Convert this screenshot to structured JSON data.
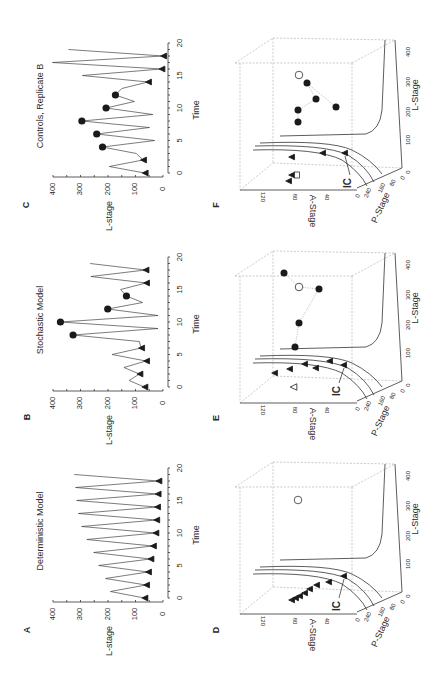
{
  "figure": {
    "panel_letters": [
      "A",
      "B",
      "C",
      "D",
      "E",
      "F"
    ],
    "ic_label": "IC"
  },
  "chart_data": [
    {
      "panel": "A",
      "type": "line",
      "title": "Deterministic Model",
      "xlabel": "Time",
      "ylabel": "L-stage",
      "xlim": [
        0,
        20
      ],
      "ylim": [
        0,
        400
      ],
      "xticks": [
        "0",
        "5",
        "10",
        "15",
        "20"
      ],
      "yticks": [
        "0",
        "100",
        "200",
        "300",
        "400"
      ],
      "x": [
        0,
        1,
        2,
        3,
        4,
        5,
        6,
        7,
        8,
        9,
        10,
        11,
        12,
        13,
        14,
        15,
        16,
        17,
        18,
        19
      ],
      "values": [
        68,
        191,
        62,
        209,
        55,
        234,
        46,
        252,
        37,
        277,
        28,
        296,
        25,
        308,
        22,
        314,
        20,
        318,
        17,
        323
      ],
      "markers": [
        {
          "t": 0,
          "shape": "triangle"
        },
        {
          "t": 2,
          "shape": "triangle"
        },
        {
          "t": 4,
          "shape": "triangle"
        },
        {
          "t": 6,
          "shape": "triangle"
        },
        {
          "t": 8,
          "shape": "triangle"
        },
        {
          "t": 10,
          "shape": "triangle"
        },
        {
          "t": 12,
          "shape": "triangle"
        },
        {
          "t": 14,
          "shape": "triangle"
        },
        {
          "t": 16,
          "shape": "triangle"
        },
        {
          "t": 18,
          "shape": "triangle"
        }
      ]
    },
    {
      "panel": "B",
      "type": "line",
      "title": "Stochastic Model",
      "xlabel": "Time",
      "ylabel": "L-stage",
      "xlim": [
        0,
        20
      ],
      "ylim": [
        0,
        400
      ],
      "xticks": [
        "0",
        "5",
        "10",
        "15",
        "20"
      ],
      "yticks": [
        "0",
        "100",
        "200",
        "300",
        "400"
      ],
      "x": [
        0,
        1,
        2,
        3,
        4,
        5,
        6,
        7,
        8,
        9,
        10,
        11,
        12,
        13,
        14,
        15,
        16,
        17,
        18,
        19
      ],
      "values": [
        68,
        123,
        86,
        142,
        62,
        185,
        80,
        86,
        327,
        18,
        373,
        18,
        201,
        74,
        133,
        154,
        62,
        262,
        64,
        265
      ],
      "markers": [
        {
          "t": 0,
          "shape": "triangle"
        },
        {
          "t": 2,
          "shape": "triangle"
        },
        {
          "t": 4,
          "shape": "triangle"
        },
        {
          "t": 6,
          "shape": "triangle"
        },
        {
          "t": 8,
          "shape": "circle"
        },
        {
          "t": 10,
          "shape": "circle"
        },
        {
          "t": 12,
          "shape": "circle"
        },
        {
          "t": 14,
          "shape": "circle"
        },
        {
          "t": 16,
          "shape": "triangle"
        },
        {
          "t": 18,
          "shape": "triangle"
        }
      ]
    },
    {
      "panel": "C",
      "type": "line",
      "title": "Controls, Replicate B",
      "xlabel": "Time",
      "ylabel": "L-stage",
      "xlim": [
        0,
        20
      ],
      "ylim": [
        0,
        400
      ],
      "xticks": [
        "0",
        "5",
        "10",
        "15",
        "20"
      ],
      "yticks": [
        "0",
        "100",
        "200",
        "300",
        "400"
      ],
      "x": [
        0,
        1,
        2,
        3,
        4,
        5,
        6,
        7,
        8,
        9,
        10,
        11,
        12,
        13,
        14,
        15,
        16,
        17,
        18,
        19
      ],
      "values": [
        67,
        195,
        73,
        97,
        220,
        30,
        241,
        49,
        295,
        37,
        207,
        104,
        173,
        150,
        55,
        293,
        6,
        402,
        0,
        344
      ],
      "markers": [
        {
          "t": 0,
          "shape": "triangle"
        },
        {
          "t": 2,
          "shape": "triangle"
        },
        {
          "t": 4,
          "shape": "circle"
        },
        {
          "t": 6,
          "shape": "circle"
        },
        {
          "t": 8,
          "shape": "circle"
        },
        {
          "t": 10,
          "shape": "circle"
        },
        {
          "t": 12,
          "shape": "circle"
        },
        {
          "t": 14,
          "shape": "triangle"
        },
        {
          "t": 16,
          "shape": "triangle"
        },
        {
          "t": 18,
          "shape": "triangle"
        }
      ]
    },
    {
      "panel": "D",
      "type": "scatter",
      "subtype": "3d-phase-space",
      "axes": {
        "x": "L-Stage",
        "y": "P-Stage",
        "z": "A-Stage"
      },
      "xticks": [
        "0",
        "100",
        "200",
        "300",
        "400"
      ],
      "yticks": [
        "0",
        "80",
        "160",
        "240",
        "0"
      ],
      "zticks": [
        "40",
        "80",
        "120"
      ],
      "annotation": "IC",
      "triangles": [
        [
          292,
          600
        ],
        [
          296,
          598
        ],
        [
          300,
          596
        ],
        [
          305,
          593
        ],
        [
          310,
          589
        ],
        [
          317,
          585
        ],
        [
          329,
          582
        ],
        [
          344,
          576
        ]
      ],
      "open_markers": [
        {
          "shape": "circle",
          "pos": [
            298,
            500
          ]
        }
      ],
      "ic_pos": [
        337,
        606
      ]
    },
    {
      "panel": "E",
      "type": "scatter",
      "subtype": "3d-phase-space",
      "axes": {
        "x": "L-Stage",
        "y": "P-Stage",
        "z": "A-Stage"
      },
      "xticks": [
        "0",
        "100",
        "200",
        "300",
        "400"
      ],
      "yticks": [
        "0",
        "80",
        "160",
        "240",
        "0"
      ],
      "zticks": [
        "40",
        "80",
        "120"
      ],
      "annotation": "IC",
      "triangles": [
        [
          275,
          373
        ],
        [
          290,
          369
        ],
        [
          305,
          364
        ],
        [
          316,
          368
        ],
        [
          330,
          361
        ],
        [
          344,
          365
        ]
      ],
      "circles": [
        [
          284,
          273
        ],
        [
          299,
          287
        ],
        [
          319,
          289
        ],
        [
          299,
          323
        ],
        [
          295,
          347
        ]
      ],
      "open_markers": [
        {
          "shape": "triangle",
          "pos": [
            294,
            387
          ]
        },
        {
          "shape": "circle",
          "pos": [
            299,
            287
          ]
        }
      ],
      "ic_pos": [
        337,
        391
      ]
    },
    {
      "panel": "F",
      "type": "scatter",
      "subtype": "3d-phase-space",
      "axes": {
        "x": "L-Stage",
        "y": "P-Stage",
        "z": "A-Stage"
      },
      "xticks": [
        "0",
        "100",
        "200",
        "300",
        "400"
      ],
      "yticks": [
        "0",
        "80",
        "160",
        "240",
        "0"
      ],
      "zticks": [
        "40",
        "80",
        "120"
      ],
      "annotation": "IC",
      "triangles": [
        [
          289,
          181
        ],
        [
          292,
          175
        ],
        [
          292,
          157
        ],
        [
          323,
          153
        ],
        [
          345,
          153
        ]
      ],
      "circles": [
        [
          298,
          122
        ],
        [
          298,
          110
        ],
        [
          316,
          99
        ],
        [
          307,
          83
        ],
        [
          336,
          107
        ]
      ],
      "open_markers": [
        {
          "shape": "square",
          "pos": [
            297,
            175
          ]
        },
        {
          "shape": "circle",
          "pos": [
            299,
            75
          ]
        }
      ],
      "ic_pos": [
        348,
        183
      ]
    }
  ]
}
